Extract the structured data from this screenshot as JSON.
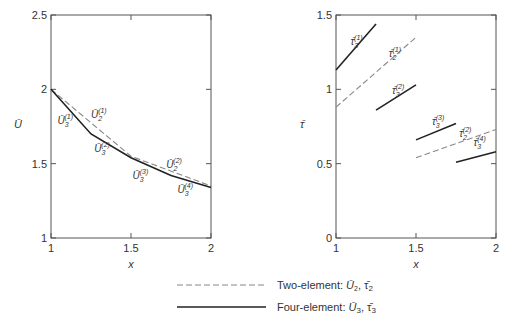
{
  "chart_data": [
    {
      "type": "line",
      "panel": "left",
      "title": "",
      "xlabel": "x",
      "ylabel": "Ū",
      "xlim": [
        1,
        2
      ],
      "ylim": [
        1,
        2.5
      ],
      "xticks": [
        1,
        1.5,
        2
      ],
      "xtick_labels": [
        "1",
        "1.5",
        "2"
      ],
      "yticks": [
        1,
        1.5,
        2,
        2.5
      ],
      "ytick_labels": [
        "1",
        "1.5",
        "2",
        "2.5"
      ],
      "grid": false,
      "series": [
        {
          "name": "Two-element: Ū2",
          "style": "dashed",
          "x": [
            1,
            1.5,
            2
          ],
          "y": [
            2.0,
            1.55,
            1.35
          ]
        },
        {
          "name": "Four-element: Ū3",
          "style": "solid",
          "x": [
            1,
            1.25,
            1.5,
            1.75,
            2
          ],
          "y": [
            2.0,
            1.7,
            1.54,
            1.42,
            1.34
          ]
        }
      ],
      "annotations": [
        {
          "base": "Ū",
          "sub": "3",
          "sup": "(1)",
          "x": 1.04,
          "y": 1.77
        },
        {
          "base": "Ū",
          "sub": "2",
          "sup": "(1)",
          "x": 1.25,
          "y": 1.81
        },
        {
          "base": "Ū",
          "sub": "3",
          "sup": "(2)",
          "x": 1.27,
          "y": 1.58
        },
        {
          "base": "Ū",
          "sub": "2",
          "sup": "(2)",
          "x": 1.72,
          "y": 1.47
        },
        {
          "base": "Ū",
          "sub": "3",
          "sup": "(3)",
          "x": 1.51,
          "y": 1.4
        },
        {
          "base": "Ū",
          "sub": "3",
          "sup": "(4)",
          "x": 1.79,
          "y": 1.3
        }
      ]
    },
    {
      "type": "line",
      "panel": "right",
      "title": "",
      "xlabel": "x",
      "ylabel": "τ̄",
      "xlim": [
        1,
        2
      ],
      "ylim": [
        0,
        1.5
      ],
      "xticks": [
        1,
        1.5,
        2
      ],
      "xtick_labels": [
        "1",
        "1.5",
        "2"
      ],
      "yticks": [
        0,
        0.5,
        1,
        1.5
      ],
      "ytick_labels": [
        "0",
        "0.5",
        "1",
        "1.5"
      ],
      "grid": false,
      "series": [
        {
          "name": "Two-element: τ̄2",
          "style": "dashed",
          "segments": [
            {
              "x": [
                1,
                1.5
              ],
              "y": [
                0.88,
                1.35
              ]
            },
            {
              "x": [
                1.5,
                2
              ],
              "y": [
                0.54,
                0.73
              ]
            }
          ]
        },
        {
          "name": "Four-element: τ̄3",
          "style": "solid",
          "segments": [
            {
              "x": [
                1,
                1.25
              ],
              "y": [
                1.13,
                1.44
              ]
            },
            {
              "x": [
                1.25,
                1.5
              ],
              "y": [
                0.86,
                1.03
              ]
            },
            {
              "x": [
                1.5,
                1.75
              ],
              "y": [
                0.66,
                0.77
              ]
            },
            {
              "x": [
                1.75,
                2
              ],
              "y": [
                0.51,
                0.58
              ]
            }
          ]
        }
      ],
      "annotations": [
        {
          "base": "τ̄",
          "sub": "3",
          "sup": "(1)",
          "x": 1.09,
          "y": 1.3
        },
        {
          "base": "τ̄",
          "sub": "2",
          "sup": "(1)",
          "x": 1.33,
          "y": 1.22
        },
        {
          "base": "τ̄",
          "sub": "3",
          "sup": "(2)",
          "x": 1.35,
          "y": 0.97
        },
        {
          "base": "τ̄",
          "sub": "3",
          "sup": "(3)",
          "x": 1.6,
          "y": 0.76
        },
        {
          "base": "τ̄",
          "sub": "2",
          "sup": "(2)",
          "x": 1.77,
          "y": 0.68
        },
        {
          "base": "τ̄",
          "sub": "3",
          "sup": "(4)",
          "x": 1.86,
          "y": 0.62
        }
      ]
    }
  ],
  "legend": {
    "placement": "bottom-center",
    "items": [
      {
        "style": "dashed",
        "label": "Two-element: ",
        "sym1": "Ū",
        "sub1": "2",
        "sep": ", ",
        "sym2": "τ̄",
        "sub2": "2"
      },
      {
        "style": "solid",
        "label": "Four-element: ",
        "sym1": "Ū",
        "sub1": "3",
        "sep": ", ",
        "sym2": "τ̄",
        "sub2": "3"
      }
    ]
  }
}
